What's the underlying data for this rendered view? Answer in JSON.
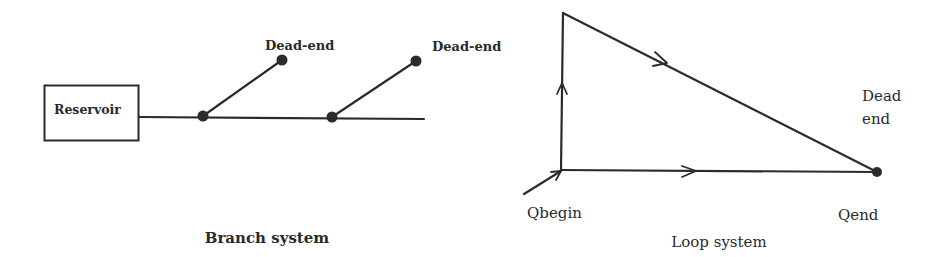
{
  "branch_system": {
    "caption": "Branch system",
    "reservoir": {
      "label": "Reservoir"
    },
    "dead_ends": [
      {
        "label": "Dead-end"
      },
      {
        "label": "Dead-end"
      }
    ]
  },
  "loop_system": {
    "caption": "Loop system",
    "labels": {
      "qbegin": "Qbegin",
      "qend": "Qend",
      "dead_end_line1": "Dead",
      "dead_end_line2": "end"
    }
  },
  "colors": {
    "line": "#2b2b2b",
    "text": "#2a2a2a",
    "background": "#ffffff"
  }
}
